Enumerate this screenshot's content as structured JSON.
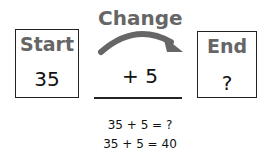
{
  "start": {
    "label": "Start",
    "value": "35"
  },
  "change": {
    "label": "Change",
    "value": "+ 5"
  },
  "end": {
    "label": "End",
    "value": "?"
  },
  "equations": [
    "35 + 5 = ?",
    "35 + 5 = 40"
  ],
  "colors": {
    "label": "#666666",
    "arrow": "#666666",
    "border": "#222222"
  }
}
